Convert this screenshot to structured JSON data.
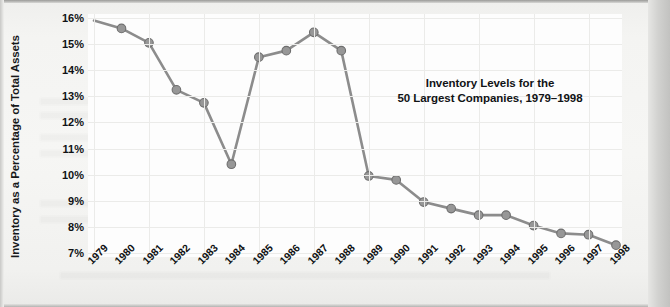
{
  "chart_data": {
    "type": "line",
    "title": "Inventory Levels for the\n50 Largest Companies, 1979–1998",
    "title_line1": "Inventory Levels for the",
    "title_line2": "50 Largest Companies, 1979–1998",
    "xlabel": "",
    "ylabel": "Inventory as a Percentage of Total Assets",
    "categories": [
      "1979",
      "1980",
      "1981",
      "1982",
      "1983",
      "1984",
      "1985",
      "1986",
      "1987",
      "1988",
      "1989",
      "1990",
      "1991",
      "1992",
      "1993",
      "1994",
      "1995",
      "1996",
      "1997",
      "1998"
    ],
    "values": [
      15.9,
      15.6,
      15.05,
      13.25,
      12.75,
      10.4,
      14.5,
      14.75,
      15.45,
      14.75,
      9.95,
      9.8,
      8.95,
      8.7,
      8.45,
      8.45,
      8.05,
      7.75,
      7.7,
      7.3
    ],
    "ylim": [
      7,
      16
    ],
    "y_ticks": [
      "7%",
      "8%",
      "9%",
      "10%",
      "11%",
      "12%",
      "13%",
      "14%",
      "15%",
      "16%"
    ],
    "y_tick_values": [
      7,
      8,
      9,
      10,
      11,
      12,
      13,
      14,
      15,
      16
    ],
    "grid": true,
    "legend": "none",
    "series_color": "#8c8c8c",
    "marker_color": "#979797",
    "marker_edge_color": "#6e6e6e",
    "plot_background": "#fdfdfd",
    "gridline_color": "#ebebe9",
    "text_color": "#101214"
  }
}
